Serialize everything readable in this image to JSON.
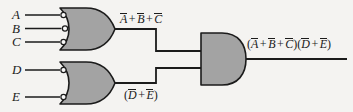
{
  "diagram": {
    "type": "logic-circuit-diagram",
    "background_color": "#f4f3f1",
    "gate_fill_color": "#a3a3a3",
    "gate_stroke_color": "#1b1b1b",
    "wire_color": "#1b1b1b",
    "bubble_fill_color": "#f8f8f8"
  },
  "inputs": [
    {
      "id": "A",
      "label": "A",
      "gate": "or-gate-top",
      "inverted": true
    },
    {
      "id": "B",
      "label": "B",
      "gate": "or-gate-top",
      "inverted": true
    },
    {
      "id": "C",
      "label": "C",
      "gate": "or-gate-top",
      "inverted": true
    },
    {
      "id": "D",
      "label": "D",
      "gate": "or-gate-bottom",
      "inverted": true
    },
    {
      "id": "E",
      "label": "E",
      "gate": "or-gate-bottom",
      "inverted": true
    }
  ],
  "gates": [
    {
      "id": "or-gate-top",
      "type": "OR",
      "inputs": [
        "A",
        "B",
        "C"
      ],
      "input_bubbles": 3,
      "output_label": {
        "terms": [
          "A",
          "B",
          "C"
        ],
        "operator": "+",
        "overbar": true,
        "parenthesized": false
      }
    },
    {
      "id": "or-gate-bottom",
      "type": "OR",
      "inputs": [
        "D",
        "E"
      ],
      "input_bubbles": 2,
      "output_label": {
        "terms": [
          "D",
          "E"
        ],
        "operator": "+",
        "overbar": true,
        "parenthesized": true
      }
    },
    {
      "id": "and-gate-output",
      "type": "AND",
      "inputs": [
        "or-gate-top",
        "or-gate-bottom"
      ],
      "input_bubbles": 0,
      "output_label": {
        "group1": [
          "A",
          "B",
          "C"
        ],
        "group2": [
          "D",
          "E"
        ],
        "operator": "+",
        "overbar": true,
        "parenthesized": true
      }
    }
  ],
  "labels": {
    "input_a": "A",
    "input_b": "B",
    "input_c": "C",
    "input_d": "D",
    "input_e": "E",
    "plus": "+",
    "paren_open": "(",
    "paren_close": ")",
    "term_a": "A",
    "term_b": "B",
    "term_c": "C",
    "term_d": "D",
    "term_e": "E"
  }
}
